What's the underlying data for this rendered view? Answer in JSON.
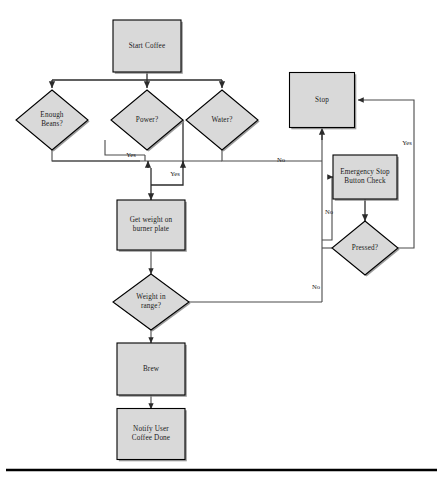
{
  "diagram": {
    "colors": {
      "node_fill": "#d9d9d9",
      "node_stroke": "#000000",
      "edge": "#4a4a4a",
      "text": "#1a1a1a",
      "shadow": "#8a8a8a",
      "background": "#ffffff"
    },
    "nodes": [
      {
        "id": "start",
        "type": "process",
        "label": "Start Coffee",
        "lines": [
          "Start Coffee"
        ],
        "cx": 147,
        "cy": 46,
        "w": 68,
        "h": 52
      },
      {
        "id": "beans",
        "type": "decision",
        "label": "Enough Beans?",
        "lines": [
          "Enough",
          "Beans?"
        ],
        "cx": 52,
        "cy": 120,
        "w": 72,
        "h": 60
      },
      {
        "id": "power",
        "type": "decision",
        "label": "Power?",
        "lines": [
          "Power?"
        ],
        "cx": 147,
        "cy": 120,
        "w": 72,
        "h": 60
      },
      {
        "id": "water",
        "type": "decision",
        "label": "Water?",
        "lines": [
          "Water?"
        ],
        "cx": 222,
        "cy": 120,
        "w": 72,
        "h": 60
      },
      {
        "id": "getweight",
        "type": "process",
        "label": "Get weight on burner plate",
        "lines": [
          "Get weight on",
          "burner plate"
        ],
        "cx": 151,
        "cy": 225,
        "w": 68,
        "h": 50
      },
      {
        "id": "weightrange",
        "type": "decision",
        "label": "Weight in range?",
        "lines": [
          "Weight in",
          "range?"
        ],
        "cx": 151,
        "cy": 302,
        "w": 76,
        "h": 56
      },
      {
        "id": "brew",
        "type": "process",
        "label": "Brew",
        "lines": [
          "Brew"
        ],
        "cx": 151,
        "cy": 369,
        "w": 68,
        "h": 52
      },
      {
        "id": "notify",
        "type": "process",
        "label": "Notify User Coffee Done",
        "lines": [
          "Notify User",
          "Coffee Done"
        ],
        "cx": 151,
        "cy": 434,
        "w": 68,
        "h": 51
      },
      {
        "id": "stop",
        "type": "process",
        "label": "Stop",
        "lines": [
          "Stop"
        ],
        "cx": 322,
        "cy": 100,
        "w": 65,
        "h": 55
      },
      {
        "id": "estop",
        "type": "process",
        "label": "Emergency Stop Button Check",
        "lines": [
          "Emergency Stop",
          "Button Check"
        ],
        "cx": 365,
        "cy": 177,
        "w": 64,
        "h": 44
      },
      {
        "id": "pressed",
        "type": "decision",
        "label": "Pressed?",
        "lines": [
          "Pressed?"
        ],
        "cx": 365,
        "cy": 248,
        "w": 66,
        "h": 54
      }
    ],
    "edge_labels": [
      {
        "id": "beans-yes",
        "text": "Yes",
        "x": 131,
        "y": 155
      },
      {
        "id": "power-yes",
        "text": "Yes",
        "x": 175,
        "y": 174
      },
      {
        "id": "water-no",
        "text": "No",
        "x": 281,
        "y": 160
      },
      {
        "id": "estop-no",
        "text": "No",
        "x": 329,
        "y": 212
      },
      {
        "id": "pressed-yes",
        "text": "Yes",
        "x": 407,
        "y": 143
      },
      {
        "id": "weight-no",
        "text": "No",
        "x": 316,
        "y": 287
      }
    ]
  }
}
